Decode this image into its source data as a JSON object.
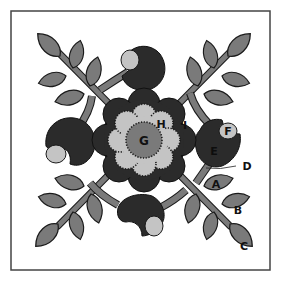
{
  "diagram": {
    "colors": {
      "background": "#ffffff",
      "frame": "#444444",
      "leaf": "#7a7a7a",
      "dark_petal": "#2b2b2b",
      "light_petal": "#c4c4c4",
      "center": "#7a7a7a",
      "outline": "#1a1a1a"
    },
    "labels": {
      "A": "A",
      "B": "B",
      "C": "C",
      "D": "D",
      "E": "E",
      "F": "F",
      "G": "G",
      "H": "H",
      "I": "I"
    },
    "label_parts": [
      {
        "id": "A",
        "part": "small leaf (first on stem)"
      },
      {
        "id": "B",
        "part": "middle leaf"
      },
      {
        "id": "C",
        "part": "end leaf"
      },
      {
        "id": "D",
        "part": "bud stem"
      },
      {
        "id": "E",
        "part": "bud (dark)"
      },
      {
        "id": "F",
        "part": "bud tip (light)"
      },
      {
        "id": "G",
        "part": "flower center"
      },
      {
        "id": "H",
        "part": "inner flower (light, scalloped)"
      },
      {
        "id": "I",
        "part": "outer flower (dark)"
      }
    ]
  }
}
